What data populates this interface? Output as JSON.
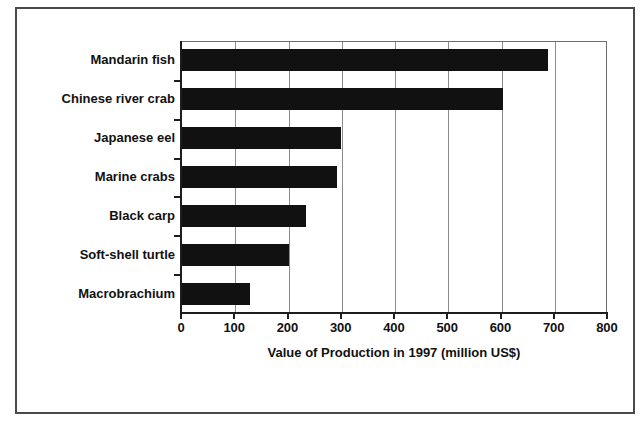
{
  "chart_data": {
    "type": "bar",
    "orientation": "horizontal",
    "title": "",
    "xlabel": "Value of Production in 1997 (million US$)",
    "ylabel": "",
    "categories": [
      "Mandarin fish",
      "Chinese river crab",
      "Japanese eel",
      "Marine crabs",
      "Black carp",
      "Soft-shell turtle",
      "Macrobrachium"
    ],
    "values": [
      690,
      605,
      300,
      293,
      235,
      202,
      130
    ],
    "xlim": [
      0,
      800
    ],
    "xticks": [
      0,
      100,
      200,
      300,
      400,
      500,
      600,
      700,
      800
    ],
    "xtick_labels": [
      "0",
      "100",
      "200",
      "300",
      "400",
      "500",
      "600",
      "700",
      "800"
    ],
    "grid": "vertical",
    "legend": "none",
    "bar_color": "#111111",
    "gridline_color": "#8c8c8c",
    "axis_color": "#1d1d1d",
    "background_color": "#ffffff",
    "frame_color": "#4a4a4a"
  }
}
